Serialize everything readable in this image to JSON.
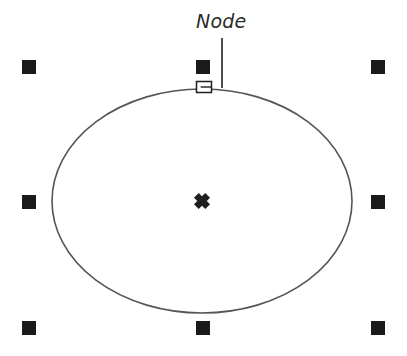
{
  "figure": {
    "title": "Node",
    "background_color": "#ffffff",
    "width": 407,
    "height": 356
  },
  "annotation": {
    "label": "Node",
    "label_x": 196,
    "label_y": 12,
    "label_color": "#2b2b2b",
    "label_font_size": 19,
    "leader_line": {
      "x1": 222,
      "y1": 38,
      "x2": 222,
      "y2": 88,
      "color": "#1f1f1f",
      "width": 1.6
    }
  },
  "shape": {
    "type": "ellipse",
    "cx": 202,
    "cy": 201,
    "rx": 150,
    "ry": 112,
    "stroke_color": "#555555",
    "stroke_width": 1.6,
    "fill": "none"
  },
  "center_marker": {
    "glyph": "✕",
    "x": 202,
    "y": 201,
    "size": 16,
    "color": "#1f1f1f"
  },
  "node_handle": {
    "x": 204,
    "y": 87,
    "width": 15,
    "height": 11,
    "stroke_color": "#1f1f1f",
    "fill": "#ffffff"
  },
  "selection_handles": {
    "size": 14,
    "color": "#1a1a1a",
    "items": [
      {
        "name": "handle-top-left",
        "cx": 29,
        "cy": 67
      },
      {
        "name": "handle-top-center",
        "cx": 203,
        "cy": 67
      },
      {
        "name": "handle-top-right",
        "cx": 378,
        "cy": 67
      },
      {
        "name": "handle-middle-left",
        "cx": 29,
        "cy": 202
      },
      {
        "name": "handle-middle-right",
        "cx": 378,
        "cy": 202
      },
      {
        "name": "handle-bottom-left",
        "cx": 29,
        "cy": 328
      },
      {
        "name": "handle-bottom-center",
        "cx": 203,
        "cy": 328
      },
      {
        "name": "handle-bottom-right",
        "cx": 378,
        "cy": 328
      }
    ]
  }
}
